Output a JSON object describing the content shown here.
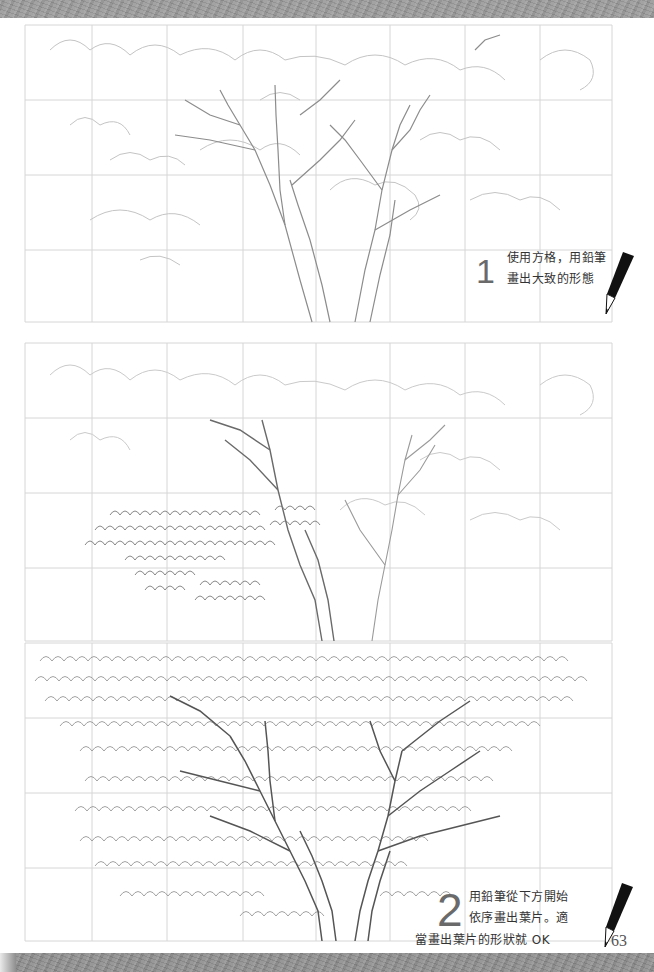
{
  "page": {
    "page_number": "63",
    "background": "#ffffff",
    "band_color": "#9a9a9a",
    "grid_color": "#d8d8d8",
    "sketch_color": "#8a8a8a"
  },
  "steps": [
    {
      "number": "1",
      "lines": [
        "使用方格，用鉛筆",
        "畫出大致的形態"
      ]
    },
    {
      "number": "2",
      "lines": [
        "用鉛筆從下方開始",
        "依序畫出葉片。適",
        "當畫出葉片的形狀就 OK"
      ]
    }
  ],
  "panels": [
    {
      "name": "step1-sketch",
      "description": "grid outline of tree trunks and canopy"
    },
    {
      "name": "step2-leaves-begin",
      "description": "leaves drawn on lower-left branches"
    },
    {
      "name": "step3-leaves-full",
      "description": "full canopy of leaves drawn"
    }
  ],
  "icons": {
    "pencil": "pencil-icon"
  }
}
